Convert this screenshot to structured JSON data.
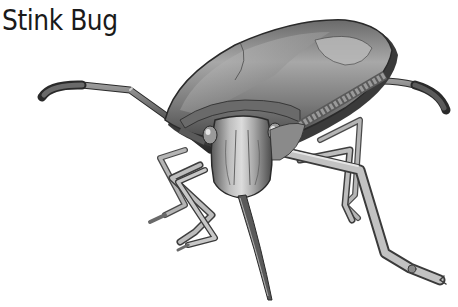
{
  "title": "Stink Bug",
  "illustration": {
    "subject": "stink bug",
    "style": "grayscale illustration",
    "colors": {
      "shell_light": "#c8c8c8",
      "shell_mid": "#8a8a8a",
      "shell_dark": "#3a3a3a",
      "outline": "#2a2a2a",
      "background": "#ffffff"
    }
  }
}
